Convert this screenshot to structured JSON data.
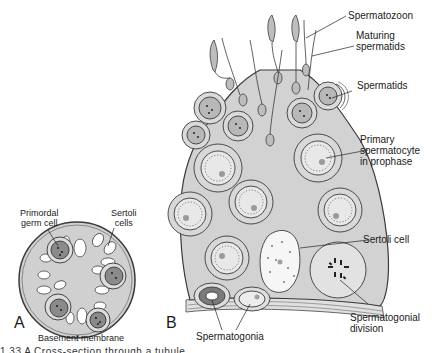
{
  "panel_a": {
    "letter": "A",
    "labels": {
      "primordial_germ_cell": [
        "Primordal",
        "germ cell"
      ],
      "sertoli_cells": [
        "Sertoli",
        "cells"
      ],
      "basement_membrane": "Basement membrane"
    }
  },
  "panel_b": {
    "letter": "B",
    "labels": {
      "spermatozoon": "Spermatozoon",
      "maturing_spermatids": [
        "Maturing",
        "spermatids"
      ],
      "spermatids": "Spermatids",
      "primary_spermatocyte": [
        "Primary",
        "spermatocyte",
        "in prophase"
      ],
      "sertoli_cell": "Sertoli cell",
      "spermatogonial_division": [
        "Spermatogonial",
        "division"
      ],
      "spermatogonia": "Spermatogonia"
    }
  },
  "caption": "1.33 A Cross-section through a tubule...",
  "colors": {
    "tissue": "#d4d4d4",
    "cell": "#c9c9c9",
    "nucleus": "#a8a8a8",
    "dark_nucleus": "#7a7a7a",
    "outline": "#3a3a3a",
    "sertoli_white": "#ffffff"
  }
}
